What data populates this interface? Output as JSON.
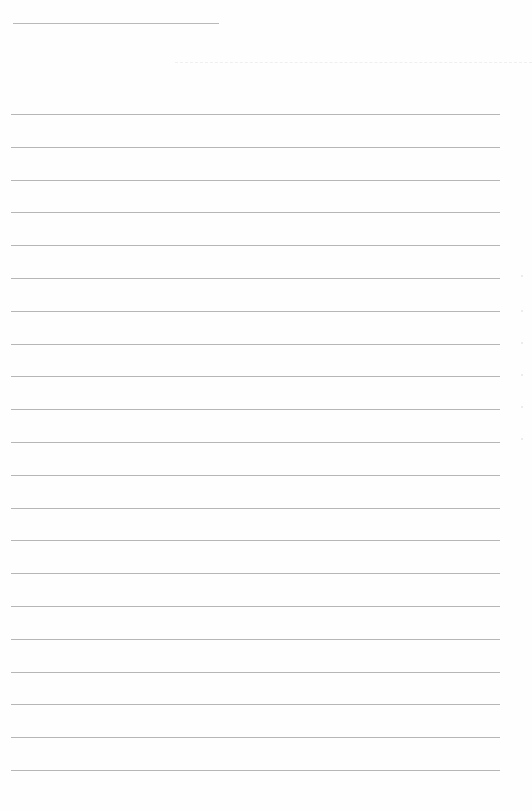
{
  "document": {
    "type": "lined-paper",
    "name_line": {
      "x": 13,
      "y": 23,
      "width": 206
    },
    "header_faint_line": {
      "x": 175,
      "y": 62,
      "width": 357
    },
    "rules": {
      "count": 21,
      "first_y": 114,
      "spacing": 32.8,
      "left": 11,
      "width": 489,
      "color": "#b6b6b6"
    },
    "margin_marks_y": [
      275,
      310,
      342,
      374,
      406,
      438
    ]
  }
}
